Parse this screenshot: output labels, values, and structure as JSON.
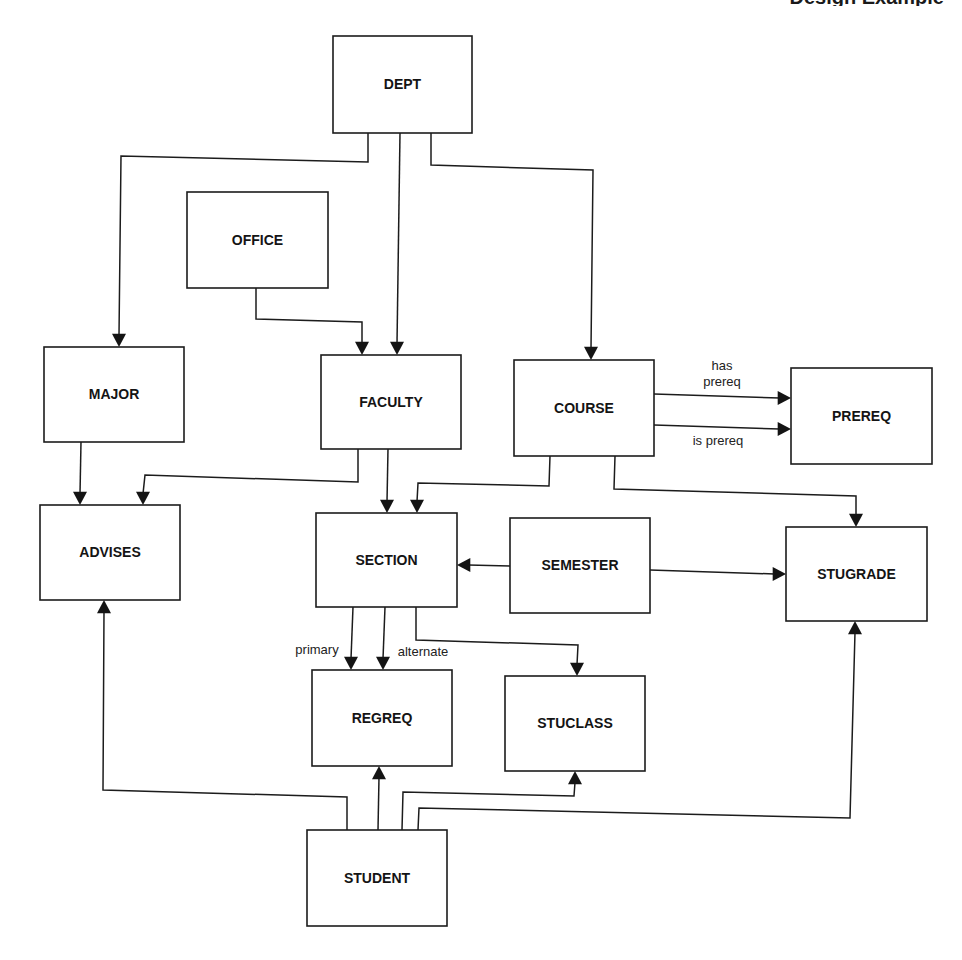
{
  "header": {
    "text": "Design Example",
    "note": "clipped at top edge"
  },
  "colors": {
    "line": "#1c1c1c",
    "text": "#141414",
    "background": "#ffffff"
  },
  "entities": [
    {
      "id": "dept",
      "label": "DEPT",
      "x": 333,
      "y": 36,
      "w": 139,
      "h": 97
    },
    {
      "id": "office",
      "label": "OFFICE",
      "x": 187,
      "y": 192,
      "w": 141,
      "h": 96
    },
    {
      "id": "major",
      "label": "MAJOR",
      "x": 44,
      "y": 347,
      "w": 140,
      "h": 95
    },
    {
      "id": "faculty",
      "label": "FACULTY",
      "x": 321,
      "y": 355,
      "w": 140,
      "h": 94
    },
    {
      "id": "course",
      "label": "COURSE",
      "x": 514,
      "y": 360,
      "w": 140,
      "h": 96
    },
    {
      "id": "prereq",
      "label": "PREREQ",
      "x": 791,
      "y": 368,
      "w": 141,
      "h": 96
    },
    {
      "id": "advises",
      "label": "ADVISES",
      "x": 40,
      "y": 505,
      "w": 140,
      "h": 95
    },
    {
      "id": "section",
      "label": "SECTION",
      "x": 316,
      "y": 513,
      "w": 141,
      "h": 94
    },
    {
      "id": "semester",
      "label": "SEMESTER",
      "x": 510,
      "y": 518,
      "w": 140,
      "h": 95
    },
    {
      "id": "stugrade",
      "label": "STUGRADE",
      "x": 786,
      "y": 527,
      "w": 141,
      "h": 94
    },
    {
      "id": "regreq",
      "label": "REGREQ",
      "x": 312,
      "y": 670,
      "w": 140,
      "h": 96
    },
    {
      "id": "stuclass",
      "label": "STUCLASS",
      "x": 505,
      "y": 676,
      "w": 140,
      "h": 95
    },
    {
      "id": "student",
      "label": "STUDENT",
      "x": 307,
      "y": 830,
      "w": 140,
      "h": 96
    }
  ],
  "relationships": [
    {
      "id": "dept-major",
      "from": "DEPT",
      "to": "MAJOR",
      "label": "",
      "points": [
        [
          368,
          133
        ],
        [
          368,
          162
        ],
        [
          121,
          156
        ],
        [
          119,
          347
        ]
      ],
      "dir": "down"
    },
    {
      "id": "dept-faculty",
      "from": "DEPT",
      "to": "FACULTY",
      "label": "",
      "points": [
        [
          400,
          133
        ],
        [
          397,
          355
        ]
      ],
      "dir": "down"
    },
    {
      "id": "dept-course",
      "from": "DEPT",
      "to": "COURSE",
      "label": "",
      "points": [
        [
          431,
          133
        ],
        [
          431,
          165
        ],
        [
          593,
          170
        ],
        [
          591,
          360
        ]
      ],
      "dir": "down"
    },
    {
      "id": "office-faculty",
      "from": "OFFICE",
      "to": "FACULTY",
      "label": "",
      "points": [
        [
          256,
          288
        ],
        [
          256,
          319
        ],
        [
          362,
          322
        ],
        [
          362,
          355
        ]
      ],
      "dir": "down"
    },
    {
      "id": "major-advises",
      "from": "MAJOR",
      "to": "ADVISES",
      "label": "",
      "points": [
        [
          81,
          442
        ],
        [
          80,
          505
        ]
      ],
      "dir": "down"
    },
    {
      "id": "faculty-advises",
      "from": "FACULTY",
      "to": "ADVISES",
      "label": "",
      "points": [
        [
          358,
          449
        ],
        [
          358,
          482
        ],
        [
          145,
          475
        ],
        [
          143,
          505
        ]
      ],
      "dir": "down"
    },
    {
      "id": "faculty-section",
      "from": "FACULTY",
      "to": "SECTION",
      "label": "",
      "points": [
        [
          388,
          449
        ],
        [
          387,
          513
        ]
      ],
      "dir": "down"
    },
    {
      "id": "course-prereq-has",
      "from": "COURSE",
      "to": "PREREQ",
      "label": "has prereq",
      "label_lines": [
        "has",
        "prereq"
      ],
      "points": [
        [
          654,
          394
        ],
        [
          791,
          398
        ]
      ],
      "dir": "right"
    },
    {
      "id": "course-prereq-is",
      "from": "COURSE",
      "to": "PREREQ",
      "label": "is prereq",
      "label_lines": [
        "is prereq"
      ],
      "points": [
        [
          654,
          425
        ],
        [
          791,
          429
        ]
      ],
      "dir": "right"
    },
    {
      "id": "course-section",
      "from": "COURSE",
      "to": "SECTION",
      "label": "",
      "points": [
        [
          550,
          456
        ],
        [
          549,
          486
        ],
        [
          418,
          483
        ],
        [
          417,
          513
        ]
      ],
      "dir": "down"
    },
    {
      "id": "course-stugrade",
      "from": "COURSE",
      "to": "STUGRADE",
      "label": "",
      "points": [
        [
          615,
          456
        ],
        [
          614,
          489
        ],
        [
          856,
          496
        ],
        [
          856,
          527
        ]
      ],
      "dir": "down"
    },
    {
      "id": "semester-section",
      "from": "SEMESTER",
      "to": "SECTION",
      "label": "",
      "points": [
        [
          510,
          566
        ],
        [
          457,
          565
        ]
      ],
      "dir": "left"
    },
    {
      "id": "semester-stugrade",
      "from": "SEMESTER",
      "to": "STUGRADE",
      "label": "",
      "points": [
        [
          650,
          570
        ],
        [
          786,
          574
        ]
      ],
      "dir": "right"
    },
    {
      "id": "section-regreq-primary",
      "from": "SECTION",
      "to": "REGREQ",
      "label": "primary",
      "label_lines": [
        "primary"
      ],
      "points": [
        [
          353,
          607
        ],
        [
          351,
          670
        ]
      ],
      "dir": "down"
    },
    {
      "id": "section-regreq-alternate",
      "from": "SECTION",
      "to": "REGREQ",
      "label": "alternate",
      "label_lines": [
        "alternate"
      ],
      "points": [
        [
          385,
          607
        ],
        [
          383,
          670
        ]
      ],
      "dir": "down"
    },
    {
      "id": "section-stuclass",
      "from": "SECTION",
      "to": "STUCLASS",
      "label": "",
      "points": [
        [
          416,
          607
        ],
        [
          416,
          640
        ],
        [
          578,
          645
        ],
        [
          577,
          676
        ]
      ],
      "dir": "down"
    },
    {
      "id": "student-advises",
      "from": "STUDENT",
      "to": "ADVISES",
      "label": "",
      "points": [
        [
          347,
          830
        ],
        [
          347,
          797
        ],
        [
          103,
          790
        ],
        [
          104,
          600
        ]
      ],
      "dir": "up"
    },
    {
      "id": "student-regreq",
      "from": "STUDENT",
      "to": "REGREQ",
      "label": "",
      "points": [
        [
          378,
          830
        ],
        [
          379,
          766
        ]
      ],
      "dir": "up"
    },
    {
      "id": "student-stuclass",
      "from": "STUDENT",
      "to": "STUCLASS",
      "label": "",
      "points": [
        [
          402,
          830
        ],
        [
          403,
          792
        ],
        [
          574,
          796
        ],
        [
          575,
          771
        ]
      ],
      "dir": "up"
    },
    {
      "id": "student-stugrade",
      "from": "STUDENT",
      "to": "STUGRADE",
      "label": "",
      "points": [
        [
          418,
          830
        ],
        [
          419,
          808
        ],
        [
          850,
          818
        ],
        [
          855,
          621
        ]
      ],
      "dir": "up"
    }
  ],
  "edge_labels": [
    {
      "for": "course-prereq-has",
      "lines": [
        "has",
        "prereq"
      ],
      "x": 722,
      "y": 370
    },
    {
      "for": "course-prereq-is",
      "lines": [
        "is prereq"
      ],
      "x": 718,
      "y": 445
    },
    {
      "for": "section-regreq-primary",
      "lines": [
        "primary"
      ],
      "x": 317,
      "y": 654
    },
    {
      "for": "section-regreq-alternate",
      "lines": [
        "alternate"
      ],
      "x": 423,
      "y": 656
    }
  ]
}
